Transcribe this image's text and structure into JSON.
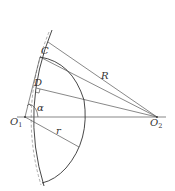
{
  "diagram": {
    "type": "geometry-figure",
    "labels": {
      "C": "C",
      "D": "D",
      "R": "R",
      "alpha": "α",
      "O1_main": "O",
      "O1_sub": "1",
      "O2_main": "O",
      "O2_sub": "2",
      "r": "r"
    },
    "points": {
      "O1": [
        25,
        117
      ],
      "O2": [
        157,
        117
      ],
      "C": [
        40,
        57
      ],
      "D": [
        36,
        88
      ]
    },
    "colors": {
      "line": "#555555",
      "arc": "#333333",
      "text": "#333333",
      "background": "#ffffff"
    }
  }
}
